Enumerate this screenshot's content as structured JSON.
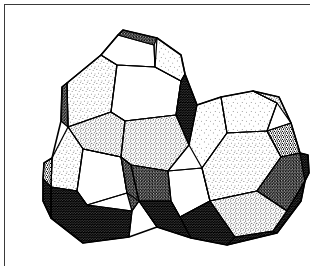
{
  "figure": {
    "title": "Cluster of three fused polyhedra",
    "medium": "stipple",
    "frame": {
      "visible": true,
      "stroke_color": "#3a3a3a",
      "stroke_width": 1,
      "x": 4,
      "y": 4,
      "width": 306,
      "height": 262
    },
    "background_color": "#ffffff",
    "ink_color": "#000000",
    "canvas": {
      "width": 322,
      "height": 279
    },
    "cluster": {
      "count": 3,
      "members": [
        {
          "name": "upper-polyhedron",
          "position": "top-center",
          "center_x": 120,
          "center_y": 95
        },
        {
          "name": "left-polyhedron",
          "position": "lower-left",
          "center_x": 95,
          "center_y": 185
        },
        {
          "name": "right-polyhedron",
          "position": "lower-right",
          "center_x": 215,
          "center_y": 170
        }
      ]
    },
    "shading": {
      "white_faces": "unshaded paper white — faces turned toward the light",
      "light_stipple": "sparse dot shading — faces at glancing light",
      "mid_stipple": "medium dot density — side faces",
      "dark_stipple": "dense dot shading — faces turned away",
      "solid_black": "near-solid ink — deep recesses and undersides"
    },
    "face_counts": {
      "white": 6,
      "light": 9,
      "medium": 8,
      "dark": 7,
      "black": 5
    }
  }
}
